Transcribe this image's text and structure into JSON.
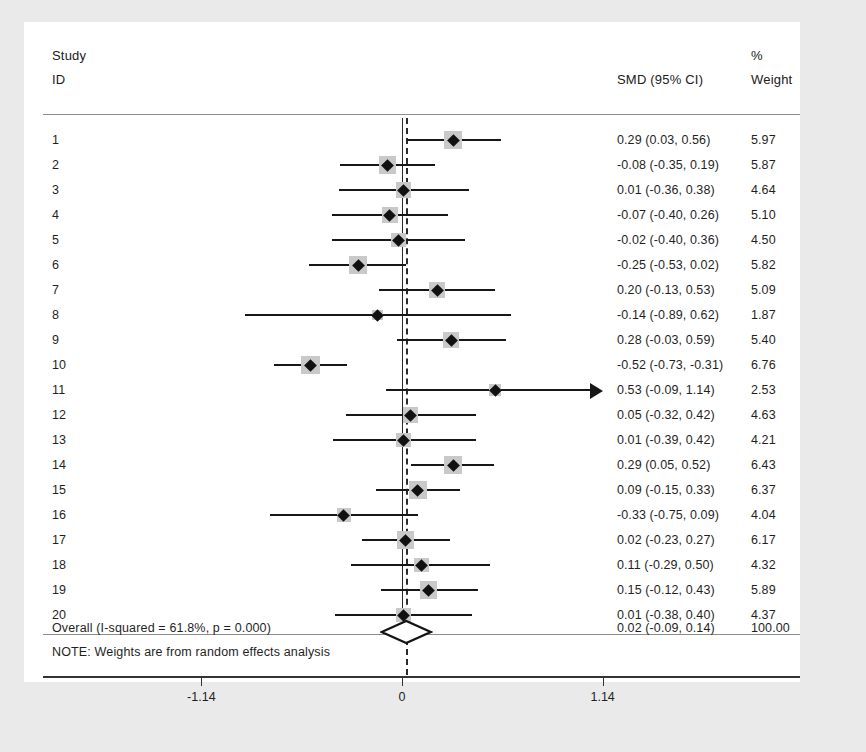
{
  "header": {
    "study_label": "Study",
    "id_label": "ID",
    "percent_label": "%",
    "weight_label": "Weight",
    "estimate_label": "SMD (95% CI)"
  },
  "note": "NOTE: Weights are from random effects analysis",
  "axis": {
    "ticks": [
      {
        "value": -1.14,
        "label": "-1.14"
      },
      {
        "value": 0,
        "label": "0"
      },
      {
        "value": 1.14,
        "label": "1.14"
      }
    ]
  },
  "overall": {
    "label": "Overall  (I-squared = 61.8%, p = 0.000)",
    "estimate_text": "0.02 (-0.09, 0.14)",
    "weight_text": "100.00",
    "smd": 0.02,
    "ci_low": -0.09,
    "ci_high": 0.14,
    "i_squared": "61.8%",
    "p_value": "0.000"
  },
  "colors": {
    "marker": "#111111",
    "weight_box": "#c9c9c9",
    "line": "#171717",
    "rule": "#8d8d8d",
    "canvas": "#ffffff",
    "page": "#eaeaea"
  },
  "chart_data": {
    "type": "forest",
    "title": "",
    "xlabel": "",
    "ylabel": "",
    "xlim": [
      -1.45,
      1.45
    ],
    "grid": false,
    "null_line": 0,
    "pooled_line": 0.02,
    "columns": [
      "Study ID",
      "SMD (95% CI)",
      "% Weight"
    ],
    "rows": [
      {
        "id": "1",
        "smd": 0.29,
        "ci_low": 0.03,
        "ci_high": 0.56,
        "weight": 5.97,
        "estimate_text": "0.29 (0.03, 0.56)",
        "weight_text": "5.97",
        "truncated_right": false
      },
      {
        "id": "2",
        "smd": -0.08,
        "ci_low": -0.35,
        "ci_high": 0.19,
        "weight": 5.87,
        "estimate_text": "-0.08 (-0.35, 0.19)",
        "weight_text": "5.87",
        "truncated_right": false
      },
      {
        "id": "3",
        "smd": 0.01,
        "ci_low": -0.36,
        "ci_high": 0.38,
        "weight": 4.64,
        "estimate_text": "0.01 (-0.36, 0.38)",
        "weight_text": "4.64",
        "truncated_right": false
      },
      {
        "id": "4",
        "smd": -0.07,
        "ci_low": -0.4,
        "ci_high": 0.26,
        "weight": 5.1,
        "estimate_text": "-0.07 (-0.40, 0.26)",
        "weight_text": "5.10",
        "truncated_right": false
      },
      {
        "id": "5",
        "smd": -0.02,
        "ci_low": -0.4,
        "ci_high": 0.36,
        "weight": 4.5,
        "estimate_text": "-0.02 (-0.40, 0.36)",
        "weight_text": "4.50",
        "truncated_right": false
      },
      {
        "id": "6",
        "smd": -0.25,
        "ci_low": -0.53,
        "ci_high": 0.02,
        "weight": 5.82,
        "estimate_text": "-0.25 (-0.53, 0.02)",
        "weight_text": "5.82",
        "truncated_right": false
      },
      {
        "id": "7",
        "smd": 0.2,
        "ci_low": -0.13,
        "ci_high": 0.53,
        "weight": 5.09,
        "estimate_text": "0.20 (-0.13, 0.53)",
        "weight_text": "5.09",
        "truncated_right": false
      },
      {
        "id": "8",
        "smd": -0.14,
        "ci_low": -0.89,
        "ci_high": 0.62,
        "weight": 1.87,
        "estimate_text": "-0.14 (-0.89, 0.62)",
        "weight_text": "1.87",
        "truncated_right": false
      },
      {
        "id": "9",
        "smd": 0.28,
        "ci_low": -0.03,
        "ci_high": 0.59,
        "weight": 5.4,
        "estimate_text": "0.28 (-0.03, 0.59)",
        "weight_text": "5.40",
        "truncated_right": false
      },
      {
        "id": "10",
        "smd": -0.52,
        "ci_low": -0.73,
        "ci_high": -0.31,
        "weight": 6.76,
        "estimate_text": "-0.52 (-0.73, -0.31)",
        "weight_text": "6.76",
        "truncated_right": false
      },
      {
        "id": "11",
        "smd": 0.53,
        "ci_low": -0.09,
        "ci_high": 1.14,
        "weight": 2.53,
        "estimate_text": "0.53 (-0.09, 1.14)",
        "weight_text": "2.53",
        "truncated_right": true
      },
      {
        "id": "12",
        "smd": 0.05,
        "ci_low": -0.32,
        "ci_high": 0.42,
        "weight": 4.63,
        "estimate_text": "0.05 (-0.32, 0.42)",
        "weight_text": "4.63",
        "truncated_right": false
      },
      {
        "id": "13",
        "smd": 0.01,
        "ci_low": -0.39,
        "ci_high": 0.42,
        "weight": 4.21,
        "estimate_text": "0.01 (-0.39, 0.42)",
        "weight_text": "4.21",
        "truncated_right": false
      },
      {
        "id": "14",
        "smd": 0.29,
        "ci_low": 0.05,
        "ci_high": 0.52,
        "weight": 6.43,
        "estimate_text": "0.29 (0.05, 0.52)",
        "weight_text": "6.43",
        "truncated_right": false
      },
      {
        "id": "15",
        "smd": 0.09,
        "ci_low": -0.15,
        "ci_high": 0.33,
        "weight": 6.37,
        "estimate_text": "0.09 (-0.15, 0.33)",
        "weight_text": "6.37",
        "truncated_right": false
      },
      {
        "id": "16",
        "smd": -0.33,
        "ci_low": -0.75,
        "ci_high": 0.09,
        "weight": 4.04,
        "estimate_text": "-0.33 (-0.75, 0.09)",
        "weight_text": "4.04",
        "truncated_right": false
      },
      {
        "id": "17",
        "smd": 0.02,
        "ci_low": -0.23,
        "ci_high": 0.27,
        "weight": 6.17,
        "estimate_text": "0.02 (-0.23, 0.27)",
        "weight_text": "6.17",
        "truncated_right": false
      },
      {
        "id": "18",
        "smd": 0.11,
        "ci_low": -0.29,
        "ci_high": 0.5,
        "weight": 4.32,
        "estimate_text": "0.11 (-0.29, 0.50)",
        "weight_text": "4.32",
        "truncated_right": false
      },
      {
        "id": "19",
        "smd": 0.15,
        "ci_low": -0.12,
        "ci_high": 0.43,
        "weight": 5.89,
        "estimate_text": "0.15 (-0.12, 0.43)",
        "weight_text": "5.89",
        "truncated_right": false
      },
      {
        "id": "20",
        "smd": 0.01,
        "ci_low": -0.38,
        "ci_high": 0.4,
        "weight": 4.37,
        "estimate_text": "0.01 (-0.38, 0.40)",
        "weight_text": "4.37",
        "truncated_right": false
      }
    ],
    "summary": {
      "label": "Overall  (I-squared = 61.8%, p = 0.000)",
      "smd": 0.02,
      "ci_low": -0.09,
      "ci_high": 0.14,
      "weight": 100.0
    }
  }
}
